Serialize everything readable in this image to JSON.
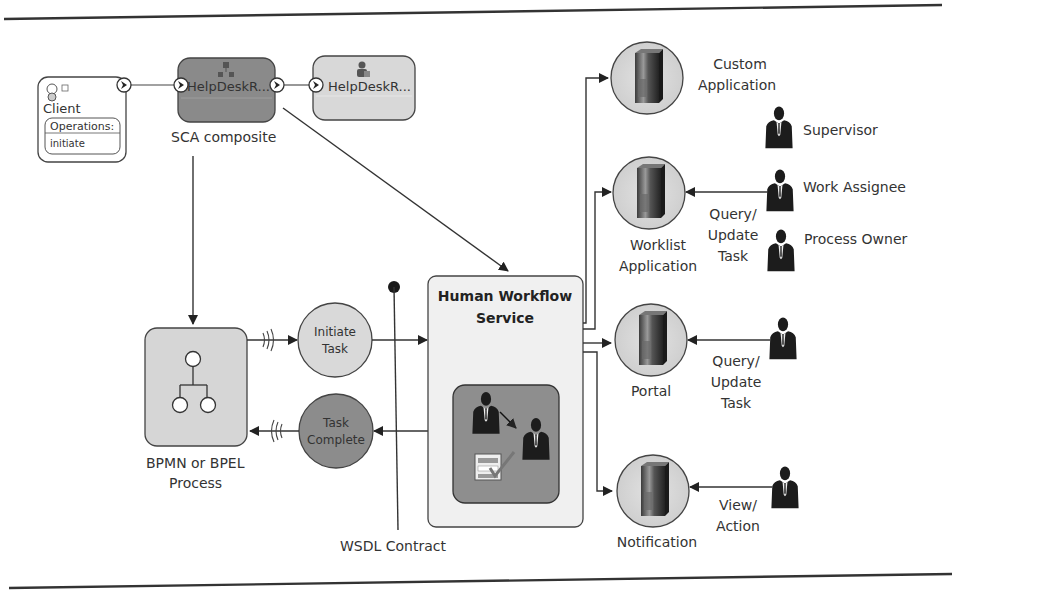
{
  "diagram": {
    "client": {
      "title": "Client",
      "operations_header": "Operations:",
      "operation": "initiate"
    },
    "sca": {
      "component_1": "HelpDeskR...",
      "component_2": "HelpDeskR...",
      "caption": "SCA composite"
    },
    "bpmn": {
      "caption_line1": "BPMN or BPEL",
      "caption_line2": "Process"
    },
    "initiate_task": {
      "line1": "Initiate",
      "line2": "Task"
    },
    "task_complete": {
      "line1": "Task",
      "line2": "Complete"
    },
    "wsdl": {
      "caption": "WSDL Contract"
    },
    "hws": {
      "title_line1": "Human Workflow",
      "title_line2": "Service"
    },
    "apps": [
      {
        "name": "custom-application",
        "line1": "Custom",
        "line2": "Application"
      },
      {
        "name": "worklist-application",
        "line1": "Worklist",
        "line2": "Application"
      },
      {
        "name": "portal",
        "line1": "Portal",
        "line2": ""
      },
      {
        "name": "notification",
        "line1": "Notification",
        "line2": ""
      }
    ],
    "roles": {
      "supervisor": "Supervisor",
      "work_assignee": "Work Assignee",
      "process_owner": "Process Owner"
    },
    "edge_labels": {
      "worklist_query": [
        "Query/",
        "Update",
        "Task"
      ],
      "portal_query": [
        "Query/",
        "Update",
        "Task"
      ],
      "notification_view": [
        "View/",
        "Action"
      ]
    },
    "colors": {
      "sca_dark": "#8a8a8a",
      "sca_light": "#d8d8d8",
      "circle_light": "#d9d9d9",
      "circle_dark": "#8c8c8c",
      "hws_bg": "#f0f0f0",
      "hws_inner": "#8e8e8e",
      "line": "#333333"
    }
  }
}
